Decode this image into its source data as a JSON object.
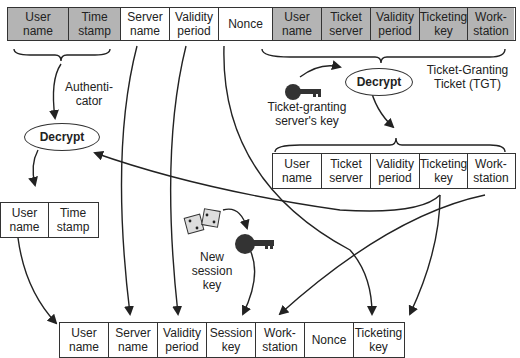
{
  "top_row": {
    "authenticator_cells": [
      {
        "label": "User\nname",
        "w": 62
      },
      {
        "label": "Time\nstamp",
        "w": 50
      }
    ],
    "plain_cells": [
      {
        "label": "Server\nname",
        "w": 49
      },
      {
        "label": "Validity\nperiod",
        "w": 49
      },
      {
        "label": "Nonce",
        "w": 50
      }
    ],
    "tgt_cells": [
      {
        "label": "User\nname",
        "w": 49
      },
      {
        "label": "Ticket\nserver",
        "w": 49
      },
      {
        "label": "Validity\nperiod",
        "w": 49
      },
      {
        "label": "Ticketing\nkey",
        "w": 48
      },
      {
        "label": "Work-\nstation",
        "w": 49
      }
    ]
  },
  "labels": {
    "authenticator": "Authenti-\ncator",
    "tgt": "Ticket-Granting\nTicket (TGT)",
    "tgs_key": "Ticket-granting\nserver's key",
    "new_session_key": "New\nsession\nkey"
  },
  "decrypt_label": "Decrypt",
  "decrypted_tgt_cells": [
    {
      "label": "User\nname",
      "w": 49
    },
    {
      "label": "Ticket\nserver",
      "w": 49
    },
    {
      "label": "Validity\nperiod",
      "w": 49
    },
    {
      "label": "Ticketing\nkey",
      "w": 48
    },
    {
      "label": "Work-\nstation",
      "w": 49
    }
  ],
  "decrypted_auth_cells": [
    {
      "label": "User\nname",
      "w": 48
    },
    {
      "label": "Time\nstamp",
      "w": 50
    }
  ],
  "bottom_row_cells": [
    {
      "label": "User\nname",
      "w": 49
    },
    {
      "label": "Server\nname",
      "w": 49
    },
    {
      "label": "Validity\nperiod",
      "w": 49
    },
    {
      "label": "Session\nkey",
      "w": 49
    },
    {
      "label": "Work-\nstation",
      "w": 49
    },
    {
      "label": "Nonce",
      "w": 49
    },
    {
      "label": "Ticketing\nkey",
      "w": 49
    }
  ],
  "colors": {
    "encrypted_fill": "#b4b4b4",
    "line": "#222222"
  }
}
